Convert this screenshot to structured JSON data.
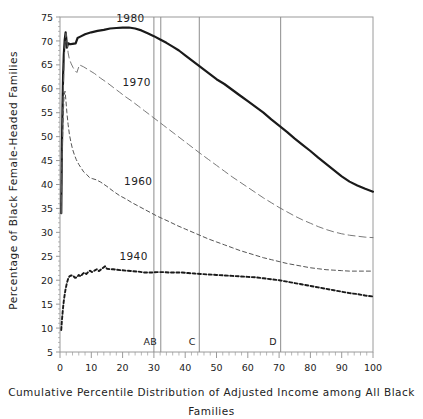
{
  "chart_data": {
    "type": "line",
    "title": "",
    "xlabel": "Cumulative Percentile Distribution of Adjusted Income among All Black Families",
    "ylabel": "Percentage of Black Female-Headed Families",
    "xlim": [
      0,
      100
    ],
    "ylim": [
      5,
      75
    ],
    "xticks": [
      0,
      10,
      20,
      30,
      40,
      50,
      60,
      70,
      80,
      90,
      100
    ],
    "yticks": [
      5,
      10,
      15,
      20,
      25,
      30,
      35,
      40,
      45,
      50,
      55,
      60,
      65,
      70,
      75
    ],
    "xtick_minor_step": 2,
    "grid": false,
    "legend": "inline-annotations",
    "annotations": [
      {
        "text": "1980",
        "x": 22.5,
        "y": 74.0
      },
      {
        "text": "1970",
        "x": 24.5,
        "y": 60.5
      },
      {
        "text": "1960",
        "x": 25.0,
        "y": 40.0
      },
      {
        "text": "1940",
        "x": 23.5,
        "y": 24.2
      }
    ],
    "reference_lines": [
      {
        "label": "A",
        "x": 30.0
      },
      {
        "label": "B",
        "x": 32.2
      },
      {
        "label": "C",
        "x": 44.5
      },
      {
        "label": "D",
        "x": 70.5
      }
    ],
    "series": [
      {
        "name": "1980",
        "style": "solid-thick",
        "color": "#1a1a1a",
        "points": [
          [
            0.4,
            34.0
          ],
          [
            0.6,
            47.0
          ],
          [
            0.8,
            56.0
          ],
          [
            1.0,
            63.0
          ],
          [
            1.2,
            67.0
          ],
          [
            1.5,
            70.2
          ],
          [
            1.8,
            71.8
          ],
          [
            2.0,
            70.6
          ],
          [
            2.2,
            68.6
          ],
          [
            2.6,
            69.5
          ],
          [
            3.2,
            69.3
          ],
          [
            4.0,
            69.4
          ],
          [
            5.0,
            69.5
          ],
          [
            5.6,
            70.6
          ],
          [
            6.5,
            70.9
          ],
          [
            8.0,
            71.4
          ],
          [
            10.0,
            71.8
          ],
          [
            12.0,
            72.1
          ],
          [
            14.0,
            72.3
          ],
          [
            16.0,
            72.6
          ],
          [
            18.0,
            72.7
          ],
          [
            20.0,
            72.8
          ],
          [
            22.0,
            72.8
          ],
          [
            24.0,
            72.6
          ],
          [
            26.0,
            72.2
          ],
          [
            28.0,
            71.6
          ],
          [
            30.0,
            71.0
          ],
          [
            32.0,
            70.3
          ],
          [
            34.0,
            69.6
          ],
          [
            36.0,
            68.8
          ],
          [
            38.0,
            68.0
          ],
          [
            40.0,
            67.0
          ],
          [
            42.0,
            66.0
          ],
          [
            44.0,
            65.0
          ],
          [
            46.0,
            64.0
          ],
          [
            48.0,
            63.0
          ],
          [
            50.0,
            62.0
          ],
          [
            52.5,
            61.0
          ],
          [
            55.0,
            59.8
          ],
          [
            57.5,
            58.6
          ],
          [
            60.0,
            57.4
          ],
          [
            62.5,
            56.2
          ],
          [
            65.0,
            55.0
          ],
          [
            67.5,
            53.6
          ],
          [
            70.0,
            52.3
          ],
          [
            72.5,
            51.0
          ],
          [
            75.0,
            49.6
          ],
          [
            77.5,
            48.3
          ],
          [
            80.0,
            47.0
          ],
          [
            82.5,
            45.6
          ],
          [
            85.0,
            44.3
          ],
          [
            87.5,
            43.0
          ],
          [
            90.0,
            41.7
          ],
          [
            92.5,
            40.6
          ],
          [
            95.0,
            39.8
          ],
          [
            97.5,
            39.1
          ],
          [
            100.0,
            38.5
          ]
        ]
      },
      {
        "name": "1970",
        "style": "dash-long",
        "color": "#6a6a6a",
        "points": [
          [
            0.4,
            34.0
          ],
          [
            0.7,
            48.0
          ],
          [
            1.0,
            58.0
          ],
          [
            1.3,
            65.0
          ],
          [
            1.6,
            69.5
          ],
          [
            1.9,
            71.6
          ],
          [
            2.2,
            70.0
          ],
          [
            2.6,
            67.5
          ],
          [
            3.0,
            66.2
          ],
          [
            3.6,
            65.2
          ],
          [
            4.2,
            64.4
          ],
          [
            4.8,
            63.8
          ],
          [
            5.4,
            63.4
          ],
          [
            6.2,
            65.0
          ],
          [
            7.5,
            64.6
          ],
          [
            9.0,
            64.0
          ],
          [
            11.0,
            63.2
          ],
          [
            13.0,
            62.2
          ],
          [
            15.0,
            61.3
          ],
          [
            17.0,
            60.3
          ],
          [
            19.0,
            59.3
          ],
          [
            21.0,
            58.3
          ],
          [
            23.0,
            57.4
          ],
          [
            25.0,
            56.4
          ],
          [
            27.0,
            55.4
          ],
          [
            29.0,
            54.4
          ],
          [
            31.0,
            53.4
          ],
          [
            33.0,
            52.4
          ],
          [
            35.0,
            51.4
          ],
          [
            37.0,
            50.4
          ],
          [
            39.0,
            49.4
          ],
          [
            41.0,
            48.4
          ],
          [
            43.0,
            47.4
          ],
          [
            45.0,
            46.4
          ],
          [
            47.5,
            45.2
          ],
          [
            50.0,
            44.0
          ],
          [
            52.5,
            42.8
          ],
          [
            55.0,
            41.6
          ],
          [
            57.5,
            40.5
          ],
          [
            60.0,
            39.4
          ],
          [
            62.5,
            38.3
          ],
          [
            65.0,
            37.2
          ],
          [
            67.5,
            36.2
          ],
          [
            70.0,
            35.2
          ],
          [
            72.5,
            34.3
          ],
          [
            75.0,
            33.4
          ],
          [
            77.5,
            32.6
          ],
          [
            80.0,
            31.9
          ],
          [
            82.5,
            31.2
          ],
          [
            85.0,
            30.6
          ],
          [
            87.5,
            30.1
          ],
          [
            90.0,
            29.7
          ],
          [
            92.5,
            29.4
          ],
          [
            95.0,
            29.2
          ],
          [
            97.5,
            29.0
          ],
          [
            100.0,
            28.9
          ]
        ]
      },
      {
        "name": "1960",
        "style": "dash-medium",
        "color": "#555555",
        "points": [
          [
            0.4,
            34.0
          ],
          [
            0.7,
            46.0
          ],
          [
            1.0,
            54.0
          ],
          [
            1.3,
            58.5
          ],
          [
            1.6,
            59.5
          ],
          [
            1.9,
            57.5
          ],
          [
            2.2,
            55.0
          ],
          [
            2.6,
            52.5
          ],
          [
            3.0,
            50.5
          ],
          [
            3.5,
            48.8
          ],
          [
            4.0,
            47.4
          ],
          [
            4.6,
            46.2
          ],
          [
            5.2,
            45.2
          ],
          [
            6.0,
            44.2
          ],
          [
            6.8,
            43.4
          ],
          [
            7.6,
            42.6
          ],
          [
            8.5,
            42.1
          ],
          [
            9.5,
            41.4
          ],
          [
            10.5,
            41.2
          ],
          [
            11.5,
            41.0
          ],
          [
            13.0,
            40.5
          ],
          [
            15.0,
            39.6
          ],
          [
            17.0,
            38.6
          ],
          [
            19.0,
            37.7
          ],
          [
            21.0,
            37.0
          ],
          [
            23.0,
            36.2
          ],
          [
            25.0,
            35.5
          ],
          [
            27.0,
            34.8
          ],
          [
            29.0,
            34.1
          ],
          [
            31.0,
            33.4
          ],
          [
            33.0,
            32.8
          ],
          [
            35.0,
            32.2
          ],
          [
            37.5,
            31.4
          ],
          [
            40.0,
            30.7
          ],
          [
            42.5,
            30.0
          ],
          [
            45.0,
            29.3
          ],
          [
            47.5,
            28.6
          ],
          [
            50.0,
            28.0
          ],
          [
            52.5,
            27.4
          ],
          [
            55.0,
            26.8
          ],
          [
            57.5,
            26.2
          ],
          [
            60.0,
            25.7
          ],
          [
            62.5,
            25.2
          ],
          [
            65.0,
            24.7
          ],
          [
            67.5,
            24.3
          ],
          [
            70.0,
            23.9
          ],
          [
            72.5,
            23.5
          ],
          [
            75.0,
            23.2
          ],
          [
            77.5,
            22.9
          ],
          [
            80.0,
            22.6
          ],
          [
            82.5,
            22.4
          ],
          [
            85.0,
            22.2
          ],
          [
            87.5,
            22.1
          ],
          [
            90.0,
            22.0
          ],
          [
            92.5,
            21.9
          ],
          [
            95.0,
            21.9
          ],
          [
            97.5,
            21.9
          ],
          [
            100.0,
            21.9
          ]
        ]
      },
      {
        "name": "1940",
        "style": "dash-short-thick",
        "color": "#1a1a1a",
        "points": [
          [
            0.4,
            9.6
          ],
          [
            0.6,
            11.5
          ],
          [
            0.8,
            13.0
          ],
          [
            1.0,
            14.4
          ],
          [
            1.2,
            15.6
          ],
          [
            1.5,
            17.0
          ],
          [
            1.8,
            18.2
          ],
          [
            2.2,
            19.4
          ],
          [
            2.6,
            20.3
          ],
          [
            3.0,
            20.8
          ],
          [
            3.6,
            21.0
          ],
          [
            4.2,
            20.9
          ],
          [
            4.8,
            20.5
          ],
          [
            5.4,
            20.6
          ],
          [
            6.0,
            21.1
          ],
          [
            6.6,
            20.8
          ],
          [
            7.2,
            21.3
          ],
          [
            7.8,
            21.6
          ],
          [
            8.4,
            21.3
          ],
          [
            9.0,
            21.7
          ],
          [
            9.6,
            22.0
          ],
          [
            10.2,
            21.7
          ],
          [
            11.0,
            22.0
          ],
          [
            11.8,
            22.3
          ],
          [
            12.4,
            21.9
          ],
          [
            13.0,
            22.2
          ],
          [
            13.8,
            22.6
          ],
          [
            14.4,
            22.9
          ],
          [
            15.0,
            22.4
          ],
          [
            16.0,
            22.3
          ],
          [
            17.0,
            22.3
          ],
          [
            18.0,
            22.2
          ],
          [
            19.5,
            22.1
          ],
          [
            21.0,
            22.0
          ],
          [
            23.0,
            21.9
          ],
          [
            25.0,
            21.8
          ],
          [
            27.0,
            21.6
          ],
          [
            29.0,
            21.6
          ],
          [
            31.0,
            21.7
          ],
          [
            33.0,
            21.7
          ],
          [
            35.0,
            21.6
          ],
          [
            37.0,
            21.6
          ],
          [
            39.0,
            21.6
          ],
          [
            41.0,
            21.5
          ],
          [
            43.0,
            21.4
          ],
          [
            45.0,
            21.3
          ],
          [
            47.5,
            21.2
          ],
          [
            50.0,
            21.1
          ],
          [
            52.5,
            21.0
          ],
          [
            55.0,
            20.9
          ],
          [
            57.5,
            20.8
          ],
          [
            60.0,
            20.7
          ],
          [
            62.5,
            20.6
          ],
          [
            65.0,
            20.4
          ],
          [
            67.5,
            20.2
          ],
          [
            70.0,
            20.0
          ],
          [
            72.5,
            19.7
          ],
          [
            75.0,
            19.4
          ],
          [
            77.5,
            19.1
          ],
          [
            80.0,
            18.8
          ],
          [
            82.5,
            18.5
          ],
          [
            85.0,
            18.2
          ],
          [
            87.5,
            17.9
          ],
          [
            90.0,
            17.6
          ],
          [
            92.5,
            17.3
          ],
          [
            95.0,
            17.1
          ],
          [
            97.5,
            16.8
          ],
          [
            100.0,
            16.6
          ]
        ]
      }
    ]
  }
}
